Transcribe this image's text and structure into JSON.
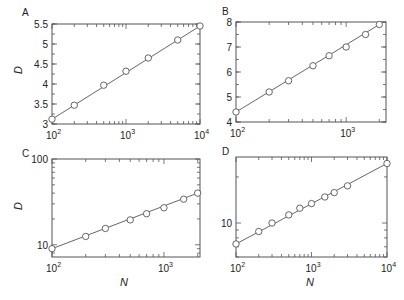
{
  "chart_data": [
    {
      "panel": "A",
      "type": "scatter",
      "xscale": "log",
      "yscale": "linear",
      "xlim": [
        100,
        10000
      ],
      "ylim": [
        3,
        5.5
      ],
      "xticks": [
        "10^2",
        "10^3",
        "10^4"
      ],
      "yticks": [
        "3",
        "3.5",
        "4",
        "4.5",
        "5",
        "5.5"
      ],
      "xlabel": "",
      "ylabel": "D",
      "x": [
        100,
        200,
        500,
        1000,
        2000,
        5000,
        10000
      ],
      "y": [
        3.12,
        3.47,
        3.97,
        4.32,
        4.65,
        5.1,
        5.45
      ],
      "fit_line": true
    },
    {
      "panel": "B",
      "type": "scatter",
      "xscale": "log",
      "yscale": "linear",
      "xlim": [
        100,
        2300
      ],
      "ylim": [
        4,
        8
      ],
      "xticks": [
        "10^2",
        "10^3"
      ],
      "yticks": [
        "4",
        "5",
        "6",
        "7",
        "8"
      ],
      "xlabel": "",
      "ylabel": "",
      "x": [
        100,
        200,
        300,
        500,
        700,
        1000,
        1500,
        2000
      ],
      "y": [
        4.4,
        5.2,
        5.65,
        6.25,
        6.65,
        7.0,
        7.5,
        7.9
      ],
      "fit_line": true
    },
    {
      "panel": "C",
      "type": "scatter",
      "xscale": "log",
      "yscale": "log",
      "xlim": [
        100,
        2100
      ],
      "ylim": [
        7.2,
        100
      ],
      "xticks": [
        "10^2",
        "10^3"
      ],
      "yticks": [
        "10",
        "100"
      ],
      "xlabel": "N",
      "ylabel": "D",
      "x": [
        100,
        200,
        300,
        500,
        700,
        1000,
        1500,
        2000
      ],
      "y": [
        9,
        12.5,
        15.5,
        19.5,
        23,
        27,
        34,
        40
      ],
      "fit_line": true
    },
    {
      "panel": "D",
      "type": "scatter",
      "xscale": "log",
      "yscale": "log",
      "xlim": [
        100,
        10000
      ],
      "ylim": [
        6,
        27
      ],
      "xticks": [
        "10^2",
        "10^3",
        "10^4"
      ],
      "yticks": [
        "10"
      ],
      "xlabel": "N",
      "ylabel": "",
      "x": [
        100,
        200,
        300,
        500,
        700,
        1000,
        1500,
        2000,
        3000,
        10000
      ],
      "y": [
        7.3,
        8.8,
        10,
        11.3,
        12.5,
        13.4,
        14.8,
        15.8,
        17.5,
        24.5
      ],
      "fit_line": true
    }
  ],
  "panels": {
    "A": {
      "label": "A",
      "ylabel": "D"
    },
    "B": {
      "label": "B"
    },
    "C": {
      "label": "C",
      "ylabel": "D",
      "xlabel": "N"
    },
    "D": {
      "label": "D",
      "xlabel": "N"
    }
  },
  "colors": {
    "ink": "#555555",
    "marker_fill": "#ffffff",
    "background": "#ffffff"
  }
}
